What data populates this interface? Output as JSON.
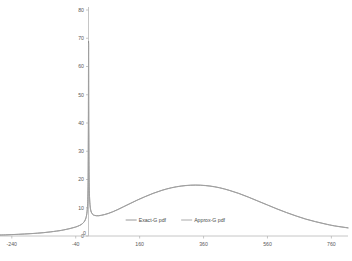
{
  "chart_data": {
    "type": "line",
    "title": "",
    "xlabel": "",
    "ylabel": "",
    "xlim": [
      -280,
      812
    ],
    "ylim": [
      0,
      80
    ],
    "grid": false,
    "legend_position": "inside-bottom-center",
    "xticks": [
      -240,
      -40,
      160,
      360,
      560,
      760
    ],
    "xtick_labels": [
      "-240",
      "-40",
      "160",
      "360",
      "560",
      "760"
    ],
    "origin_tick_label": "0",
    "yticks": [
      0,
      10,
      20,
      30,
      40,
      50,
      60,
      70,
      80
    ],
    "ytick_labels": [
      "0",
      "10",
      "20",
      "30",
      "40",
      "50",
      "60",
      "70",
      "80"
    ],
    "series": [
      {
        "name": "Exact-G pdf",
        "color": "#8c8c8c",
        "x": [
          -280,
          -260,
          -240,
          -220,
          -200,
          -180,
          -160,
          -140,
          -120,
          -100,
          -85,
          -70,
          -58,
          -48,
          -40,
          -34,
          -28,
          -23,
          -19,
          -15,
          -12,
          -9.5,
          -7.5,
          -6,
          -4.5,
          -3.2,
          -2.2,
          -1.4,
          -0.8,
          -0.3,
          0.2,
          0.7,
          1.3,
          2.1,
          3.2,
          4.6,
          6.4,
          8.6,
          11.4,
          15,
          19.5,
          25,
          32,
          40,
          50,
          62,
          76,
          92,
          110,
          130,
          152,
          176,
          202,
          230,
          260,
          290,
          320,
          350,
          380,
          410,
          440,
          470,
          500,
          530,
          560,
          590,
          620,
          650,
          680,
          710,
          740,
          770,
          812
        ],
        "y": [
          0.35,
          0.4,
          0.5,
          0.6,
          0.72,
          0.85,
          1.0,
          1.2,
          1.45,
          1.75,
          2.0,
          2.35,
          2.65,
          2.95,
          3.2,
          3.45,
          3.75,
          4.05,
          4.4,
          4.85,
          5.3,
          5.9,
          6.6,
          7.4,
          8.6,
          10.4,
          13.0,
          17.5,
          25.0,
          41.0,
          69.0,
          44.0,
          28.0,
          19.0,
          14.0,
          11.2,
          9.5,
          8.5,
          7.9,
          7.5,
          7.3,
          7.2,
          7.2,
          7.35,
          7.6,
          8.0,
          8.6,
          9.4,
          10.4,
          11.5,
          12.7,
          13.9,
          15.1,
          16.2,
          17.1,
          17.7,
          18.0,
          18.0,
          17.7,
          17.1,
          16.2,
          15.1,
          13.8,
          12.4,
          11.0,
          9.6,
          8.3,
          7.1,
          6.0,
          5.1,
          4.3,
          3.6,
          2.9
        ]
      },
      {
        "name": "Approx-G pdf",
        "color": "#a0a0a0",
        "x": [
          -280,
          -260,
          -240,
          -220,
          -200,
          -180,
          -160,
          -140,
          -120,
          -100,
          -85,
          -70,
          -58,
          -48,
          -40,
          -34,
          -28,
          -23,
          -19,
          -15,
          -12,
          -9.5,
          -7.5,
          -6,
          -4.5,
          -3.2,
          -2.2,
          -1.4,
          -0.8,
          -0.3,
          0.2,
          0.7,
          1.3,
          2.1,
          3.2,
          4.6,
          6.4,
          8.6,
          11.4,
          15,
          19.5,
          25,
          32,
          40,
          50,
          62,
          76,
          92,
          110,
          130,
          152,
          176,
          202,
          230,
          260,
          290,
          320,
          350,
          380,
          410,
          440,
          470,
          500,
          530,
          560,
          590,
          620,
          650,
          680,
          710,
          740,
          770,
          812
        ],
        "y": [
          0.33,
          0.38,
          0.48,
          0.58,
          0.7,
          0.83,
          0.98,
          1.18,
          1.43,
          1.72,
          1.97,
          2.32,
          2.62,
          2.92,
          3.17,
          3.42,
          3.72,
          4.02,
          4.37,
          4.8,
          5.25,
          5.85,
          6.55,
          7.35,
          8.5,
          10.3,
          12.9,
          17.3,
          24.7,
          40.5,
          68.2,
          43.5,
          27.7,
          18.8,
          13.9,
          11.1,
          9.4,
          8.45,
          7.85,
          7.45,
          7.25,
          7.15,
          7.15,
          7.3,
          7.55,
          7.95,
          8.55,
          9.35,
          10.35,
          11.45,
          12.65,
          13.85,
          15.05,
          16.15,
          17.05,
          17.65,
          17.95,
          17.95,
          17.65,
          17.05,
          16.15,
          15.05,
          13.75,
          12.35,
          10.95,
          9.55,
          8.25,
          7.05,
          5.95,
          5.05,
          4.25,
          3.55,
          2.85
        ]
      }
    ]
  },
  "legend": {
    "entries": [
      {
        "label": "Exact-G pdf",
        "color": "#8c8c8c"
      },
      {
        "label": "Approx-G pdf",
        "color": "#a0a0a0"
      }
    ]
  },
  "colors": {
    "axis": "#b8b8b8",
    "tick_text": "#5a5a5a",
    "background": "#ffffff"
  }
}
